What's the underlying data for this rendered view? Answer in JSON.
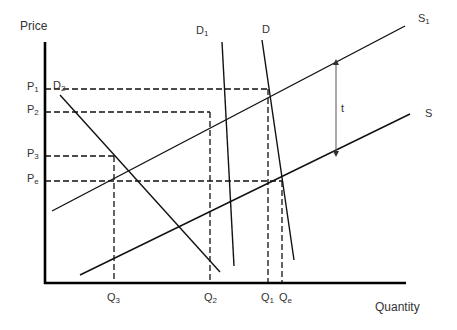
{
  "axes": {
    "y_label": "Price",
    "x_label": "Quantity"
  },
  "price_levels": [
    {
      "id": "P1",
      "base": "P",
      "sub": "1",
      "y": 89
    },
    {
      "id": "P2",
      "base": "P",
      "sub": "2",
      "y": 112
    },
    {
      "id": "P3",
      "base": "P",
      "sub": "3",
      "y": 156
    },
    {
      "id": "Pe",
      "base": "P",
      "sub": "e",
      "y": 181
    }
  ],
  "quantity_levels": [
    {
      "id": "Q3",
      "base": "Q",
      "sub": "3",
      "x": 114
    },
    {
      "id": "Q2",
      "base": "Q",
      "sub": "2",
      "x": 210
    },
    {
      "id": "Q1",
      "base": "Q",
      "sub": "1",
      "x": 268
    },
    {
      "id": "Qe",
      "base": "Q",
      "sub": "e",
      "x": 282
    }
  ],
  "curves": {
    "S1": {
      "base": "S",
      "sub": "1",
      "type": "supply"
    },
    "S": {
      "base": "S",
      "sub": "",
      "type": "supply"
    },
    "D": {
      "base": "D",
      "sub": "",
      "type": "demand"
    },
    "D1": {
      "base": "D",
      "sub": "1",
      "type": "demand"
    },
    "D2": {
      "base": "D",
      "sub": "2",
      "type": "demand"
    }
  },
  "tax_arrow": {
    "label": "t"
  },
  "colors": {
    "line": "#111111",
    "arrow": "#555555",
    "text": "#333333"
  }
}
